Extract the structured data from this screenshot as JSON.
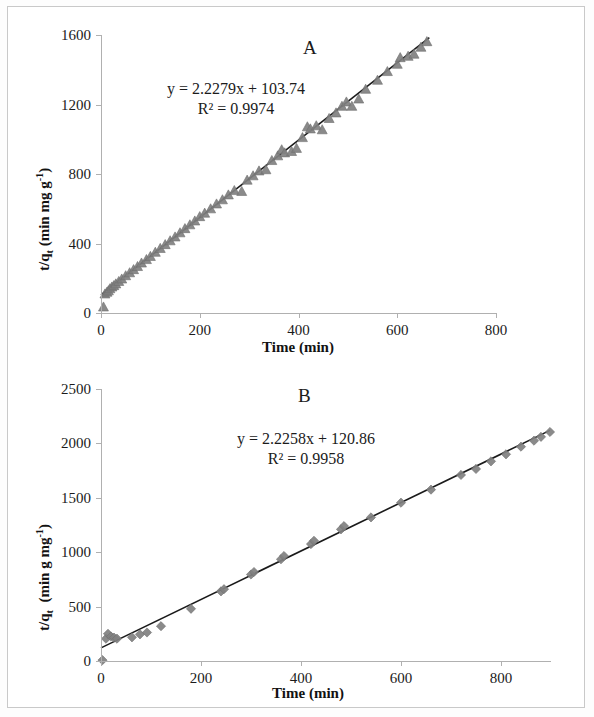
{
  "figure": {
    "background": "#ffffff",
    "frame_color": "#c9c9c9",
    "marker_color": "#808080",
    "marker_edge_color": "#6e6e6e",
    "trendline_color": "#1a1a1a",
    "axis_color": "#b0b0b0"
  },
  "chart_data": [
    {
      "type": "scatter",
      "panel_label": "A",
      "title": "",
      "xlabel": "Time (min)",
      "ylabel": "t/q_t (min mg g^-1)",
      "ylabel_parts": {
        "lead": "t/q",
        "lead_sub": "t",
        "rest": " (min mg g",
        "exp": "-1",
        "tail": ")"
      },
      "xlim": [
        0,
        800
      ],
      "ylim": [
        0,
        1600
      ],
      "xticks": [
        0,
        200,
        400,
        600,
        800
      ],
      "yticks": [
        0,
        400,
        800,
        1200,
        1600
      ],
      "grid": false,
      "legend": "none",
      "marker": "triangle",
      "annotations": {
        "equation": "y = 2.2279x + 103.74",
        "r_squared": "R² = 0.9974",
        "slope": 2.2279,
        "intercept": 103.74,
        "r2": 0.9974
      },
      "trendline": {
        "x": [
          0,
          665
        ],
        "y": [
          103.74,
          1585.3
        ]
      },
      "points": [
        {
          "x": 5,
          "y": 35
        },
        {
          "x": 8,
          "y": 110
        },
        {
          "x": 12,
          "y": 120
        },
        {
          "x": 15,
          "y": 128
        },
        {
          "x": 18,
          "y": 140
        },
        {
          "x": 22,
          "y": 150
        },
        {
          "x": 26,
          "y": 158
        },
        {
          "x": 30,
          "y": 168
        },
        {
          "x": 36,
          "y": 182
        },
        {
          "x": 42,
          "y": 196
        },
        {
          "x": 50,
          "y": 215
        },
        {
          "x": 58,
          "y": 232
        },
        {
          "x": 66,
          "y": 250
        },
        {
          "x": 74,
          "y": 268
        },
        {
          "x": 82,
          "y": 288
        },
        {
          "x": 92,
          "y": 308
        },
        {
          "x": 100,
          "y": 326
        },
        {
          "x": 110,
          "y": 350
        },
        {
          "x": 120,
          "y": 372
        },
        {
          "x": 130,
          "y": 394
        },
        {
          "x": 140,
          "y": 416
        },
        {
          "x": 150,
          "y": 438
        },
        {
          "x": 160,
          "y": 462
        },
        {
          "x": 170,
          "y": 486
        },
        {
          "x": 180,
          "y": 508
        },
        {
          "x": 190,
          "y": 530
        },
        {
          "x": 200,
          "y": 555
        },
        {
          "x": 210,
          "y": 575
        },
        {
          "x": 222,
          "y": 600
        },
        {
          "x": 234,
          "y": 628
        },
        {
          "x": 246,
          "y": 652
        },
        {
          "x": 258,
          "y": 680
        },
        {
          "x": 270,
          "y": 705
        },
        {
          "x": 285,
          "y": 700
        },
        {
          "x": 296,
          "y": 765
        },
        {
          "x": 308,
          "y": 790
        },
        {
          "x": 320,
          "y": 818
        },
        {
          "x": 334,
          "y": 825
        },
        {
          "x": 346,
          "y": 878
        },
        {
          "x": 358,
          "y": 905
        },
        {
          "x": 366,
          "y": 940
        },
        {
          "x": 372,
          "y": 922
        },
        {
          "x": 386,
          "y": 930
        },
        {
          "x": 396,
          "y": 948
        },
        {
          "x": 408,
          "y": 1010
        },
        {
          "x": 418,
          "y": 1072
        },
        {
          "x": 424,
          "y": 1060
        },
        {
          "x": 436,
          "y": 1078
        },
        {
          "x": 448,
          "y": 1055
        },
        {
          "x": 462,
          "y": 1120
        },
        {
          "x": 476,
          "y": 1152
        },
        {
          "x": 488,
          "y": 1190
        },
        {
          "x": 497,
          "y": 1215
        },
        {
          "x": 508,
          "y": 1190
        },
        {
          "x": 522,
          "y": 1232
        },
        {
          "x": 536,
          "y": 1288
        },
        {
          "x": 560,
          "y": 1340
        },
        {
          "x": 580,
          "y": 1390
        },
        {
          "x": 600,
          "y": 1432
        },
        {
          "x": 606,
          "y": 1470
        },
        {
          "x": 622,
          "y": 1478
        },
        {
          "x": 634,
          "y": 1490
        },
        {
          "x": 648,
          "y": 1530
        },
        {
          "x": 660,
          "y": 1562
        }
      ]
    },
    {
      "type": "scatter",
      "panel_label": "B",
      "title": "",
      "xlabel": "Time (min)",
      "ylabel": "t/q_t  (min g mg^-1)",
      "ylabel_parts": {
        "lead": "t/q",
        "lead_sub": "t",
        "rest": "  (min g mg",
        "exp": "-1",
        "tail": ")"
      },
      "xlim": [
        0,
        900
      ],
      "ylim": [
        0,
        2500
      ],
      "xticks": [
        0,
        200,
        400,
        600,
        800
      ],
      "yticks": [
        0,
        500,
        1000,
        1500,
        2000,
        2500
      ],
      "grid": false,
      "legend": "none",
      "marker": "diamond",
      "annotations": {
        "equation": "y = 2.2258x + 120.86",
        "r_squared": "R² = 0.9958",
        "slope": 2.2258,
        "intercept": 120.86,
        "r2": 0.9958
      },
      "trendline": {
        "x": [
          0,
          898
        ],
        "y": [
          120.86,
          2119.6
        ]
      },
      "points": [
        {
          "x": 3,
          "y": 8
        },
        {
          "x": 10,
          "y": 205
        },
        {
          "x": 14,
          "y": 250
        },
        {
          "x": 20,
          "y": 225
        },
        {
          "x": 26,
          "y": 215
        },
        {
          "x": 32,
          "y": 205
        },
        {
          "x": 62,
          "y": 218
        },
        {
          "x": 78,
          "y": 245
        },
        {
          "x": 92,
          "y": 262
        },
        {
          "x": 120,
          "y": 320
        },
        {
          "x": 180,
          "y": 480
        },
        {
          "x": 240,
          "y": 640
        },
        {
          "x": 246,
          "y": 660
        },
        {
          "x": 300,
          "y": 795
        },
        {
          "x": 306,
          "y": 818
        },
        {
          "x": 360,
          "y": 935
        },
        {
          "x": 366,
          "y": 965
        },
        {
          "x": 420,
          "y": 1075
        },
        {
          "x": 426,
          "y": 1105
        },
        {
          "x": 480,
          "y": 1210
        },
        {
          "x": 486,
          "y": 1240
        },
        {
          "x": 540,
          "y": 1320
        },
        {
          "x": 600,
          "y": 1455
        },
        {
          "x": 660,
          "y": 1575
        },
        {
          "x": 720,
          "y": 1710
        },
        {
          "x": 750,
          "y": 1765
        },
        {
          "x": 780,
          "y": 1835
        },
        {
          "x": 810,
          "y": 1900
        },
        {
          "x": 840,
          "y": 1970
        },
        {
          "x": 866,
          "y": 2025
        },
        {
          "x": 880,
          "y": 2060
        },
        {
          "x": 898,
          "y": 2105
        }
      ]
    }
  ]
}
